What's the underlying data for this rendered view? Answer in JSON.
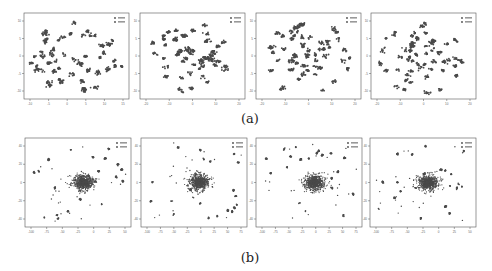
{
  "figure": {
    "caption_a": "(a)",
    "caption_b": "(b)",
    "marker_color": "#4a4a4a",
    "frame_color": "#555555"
  },
  "chart_data": [
    {
      "type": "scatter",
      "row": "a",
      "panel": 1,
      "legend": [
        "series 1",
        "series 2"
      ],
      "xticks": [
        "-10",
        "-5",
        "0",
        "5",
        "10",
        "15"
      ],
      "yticks": [
        "10",
        "5",
        "0",
        "-5",
        "-10"
      ],
      "grid": false,
      "legend_position": "upper right",
      "description": "t-SNE embedding, dispersed clusters, isolated cluster at right"
    },
    {
      "type": "scatter",
      "row": "a",
      "panel": 2,
      "legend": [
        "series 1",
        "series 2"
      ],
      "xticks": [
        "-20",
        "-10",
        "0",
        "10",
        "20"
      ],
      "yticks": [
        "10",
        "5",
        "0",
        "-5",
        "-10"
      ],
      "grid": false,
      "legend_position": "upper right",
      "description": "t-SNE embedding, many small dispersed clusters"
    },
    {
      "type": "scatter",
      "row": "a",
      "panel": 3,
      "legend": [
        "series 1",
        "series 2"
      ],
      "xticks": [
        "-20",
        "-10",
        "0",
        "10",
        "20"
      ],
      "yticks": [
        "10",
        "5",
        "0",
        "-5",
        "-10"
      ],
      "grid": false,
      "legend_position": "upper right",
      "description": "t-SNE embedding, ring-like dispersed clusters"
    },
    {
      "type": "scatter",
      "row": "a",
      "panel": 4,
      "legend": [
        "series 1",
        "series 2"
      ],
      "xticks": [
        "-20",
        "-10",
        "0",
        "10",
        "20"
      ],
      "yticks": [
        "10",
        "5",
        "0",
        "-5",
        "-10"
      ],
      "grid": false,
      "legend_position": "upper right",
      "description": "t-SNE embedding, dispersed clusters"
    },
    {
      "type": "scatter",
      "row": "b",
      "panel": 1,
      "legend": [
        "series 1",
        "series 2"
      ],
      "xticks": [
        "-100",
        "-75",
        "-50",
        "-25",
        "0",
        "25",
        "50"
      ],
      "yticks": [
        "40",
        "20",
        "0",
        "-20",
        "-40"
      ],
      "grid": false,
      "legend_position": "upper right",
      "description": "dense central blob with scattered outlier clusters"
    },
    {
      "type": "scatter",
      "row": "b",
      "panel": 2,
      "legend": [
        "series 1",
        "series 2"
      ],
      "xticks": [
        "-100",
        "-75",
        "-50",
        "-25",
        "0",
        "25",
        "50",
        "75"
      ],
      "yticks": [
        "40",
        "20",
        "0",
        "-20",
        "-40"
      ],
      "grid": false,
      "legend_position": "upper right",
      "description": "dense central blob upper-left with satellite clusters"
    },
    {
      "type": "scatter",
      "row": "b",
      "panel": 3,
      "legend": [
        "series 1",
        "series 2"
      ],
      "xticks": [
        "-100",
        "-75",
        "-50",
        "-25",
        "0",
        "25",
        "50",
        "75"
      ],
      "yticks": [
        "40",
        "20",
        "0",
        "-20",
        "-40"
      ],
      "grid": false,
      "legend_position": "upper right",
      "description": "dense central blob with many satellite clusters"
    },
    {
      "type": "scatter",
      "row": "b",
      "panel": 4,
      "legend": [
        "series 1",
        "series 2"
      ],
      "xticks": [
        "-100",
        "-75",
        "-50",
        "-25",
        "0",
        "25",
        "50"
      ],
      "yticks": [
        "40",
        "20",
        "0",
        "-20",
        "-40"
      ],
      "grid": false,
      "legend_position": "upper right",
      "description": "dense central blob with satellite clusters"
    }
  ]
}
